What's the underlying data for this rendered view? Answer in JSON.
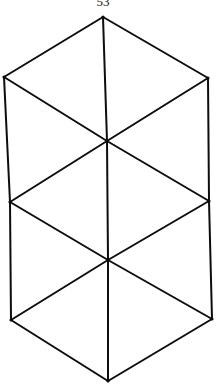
{
  "page": {
    "number": "53"
  },
  "figure": {
    "stroke_color": "#0d0d0d",
    "background": "#ffffff",
    "vertices": {
      "top": [
        103,
        17
      ],
      "upper_left": [
        4,
        77
      ],
      "upper_right": [
        208,
        78
      ],
      "center_upper": [
        107,
        141
      ],
      "middle_left": [
        10,
        202
      ],
      "middle_right": [
        209,
        201
      ],
      "center_lower": [
        108,
        260
      ],
      "lower_left": [
        11,
        320
      ],
      "lower_right": [
        212,
        319
      ],
      "bottom": [
        108,
        381
      ]
    },
    "edges": [
      [
        "top",
        "upper_left"
      ],
      [
        "top",
        "upper_right"
      ],
      [
        "upper_left",
        "middle_left"
      ],
      [
        "upper_right",
        "middle_right"
      ],
      [
        "middle_left",
        "lower_left"
      ],
      [
        "middle_right",
        "lower_right"
      ],
      [
        "lower_left",
        "bottom"
      ],
      [
        "lower_right",
        "bottom"
      ],
      [
        "top",
        "center_upper"
      ],
      [
        "upper_left",
        "center_upper"
      ],
      [
        "upper_right",
        "center_upper"
      ],
      [
        "center_upper",
        "middle_left"
      ],
      [
        "center_upper",
        "middle_right"
      ],
      [
        "center_upper",
        "center_lower"
      ],
      [
        "middle_left",
        "center_lower"
      ],
      [
        "middle_right",
        "center_lower"
      ],
      [
        "center_lower",
        "lower_left"
      ],
      [
        "center_lower",
        "lower_right"
      ],
      [
        "center_lower",
        "bottom"
      ]
    ]
  }
}
